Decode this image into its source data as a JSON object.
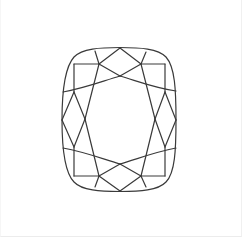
{
  "figure": {
    "subject": "Cushion cut diamond facet diagram",
    "shape_name": "cushion",
    "view": "top (crown) view",
    "colors": {
      "background": "#ffffff",
      "stroke": "#3a3a3a",
      "border": "#eeeeee"
    },
    "stroke_width": 1.2
  }
}
